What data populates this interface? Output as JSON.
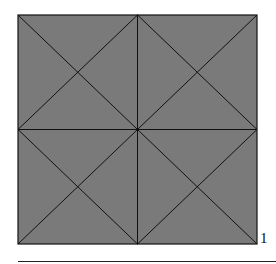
{
  "figure": {
    "fill_color": "#7a7a7a",
    "line_color": "#111111",
    "square": {
      "x": 18,
      "y": 15,
      "width": 239,
      "height": 229
    },
    "corner_label": "1"
  }
}
